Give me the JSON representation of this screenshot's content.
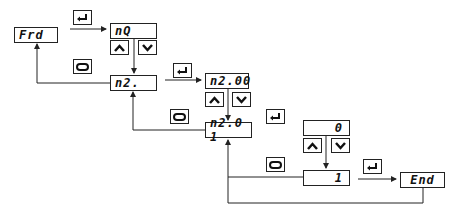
{
  "diagram": {
    "displays": {
      "frd": "Frd",
      "nq": "nQ",
      "n2": "n2.",
      "n200": "n2.00",
      "n201": "n2.0 1",
      "zero": "0",
      "one": "1",
      "end": "End"
    },
    "keys": {
      "enter": "enter-key",
      "loop": "loop-key",
      "up": "up-key",
      "down": "down-key"
    },
    "line_color": "#222222"
  }
}
